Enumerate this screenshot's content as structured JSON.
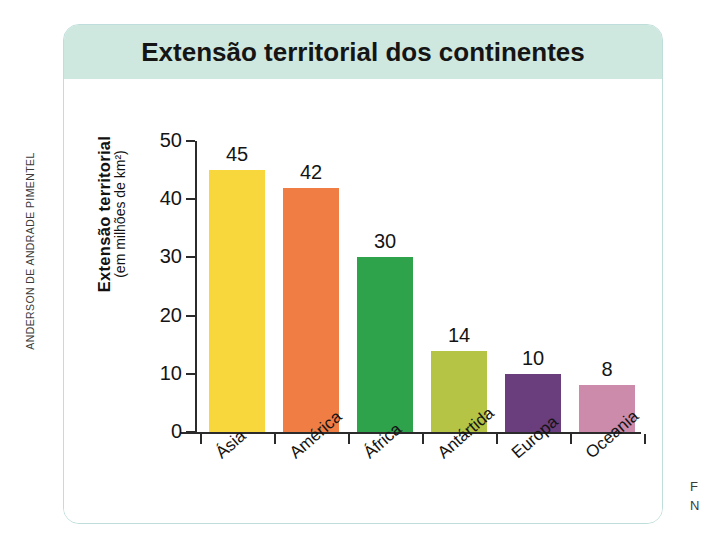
{
  "credit": {
    "text": "ANDERSON DE ANDRADE PIMENTEL"
  },
  "figure": {
    "title": "Extensão territorial dos continentes",
    "title_band_color": "#cfe8df",
    "border_color": "#bfdedb"
  },
  "edge_caption": {
    "line1": "F",
    "line2": "N"
  },
  "chart_data": {
    "type": "bar",
    "title": "Extensão territorial dos continentes",
    "xlabel": "",
    "ylabel": "Extensão territorial",
    "ylabel_sub": "(em milhões de km²)",
    "categories": [
      "Ásia",
      "América",
      "África",
      "Antártida",
      "Europa",
      "Oceania"
    ],
    "values": [
      45,
      42,
      30,
      14,
      10,
      8
    ],
    "value_labels": [
      "45",
      "42",
      "30",
      "14",
      "10",
      "8"
    ],
    "colors": [
      "#f7d73c",
      "#f07d44",
      "#2fa24c",
      "#b5c444",
      "#6a3d7c",
      "#cc8baa"
    ],
    "ylim": [
      0,
      50
    ],
    "yticks": [
      0,
      10,
      20,
      30,
      40,
      50
    ],
    "ytick_labels": [
      "0",
      "10",
      "20",
      "30",
      "40",
      "50"
    ],
    "grid": false,
    "legend": false
  }
}
